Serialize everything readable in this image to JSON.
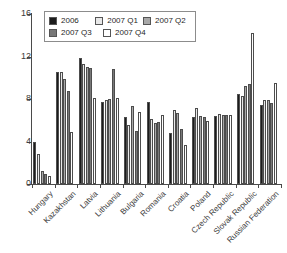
{
  "chart_data": {
    "type": "bar",
    "title": "",
    "subtitle": "",
    "xlabel": "",
    "ylabel": "",
    "ylim": [
      0,
      16
    ],
    "yticks": [
      0,
      4,
      8,
      12,
      16
    ],
    "grid": false,
    "legend_position": "top-left",
    "categories": [
      "Hungary",
      "Kazakhstan",
      "Latvia",
      "Lithuania",
      "Bulgaria",
      "Romania",
      "Croatia",
      "Poland",
      "Czech Republic",
      "Slovak Republic",
      "Russian Federation"
    ],
    "series": [
      {
        "name": "2006",
        "color": "#1c1c1c",
        "values": [
          4.0,
          10.5,
          11.9,
          7.7,
          6.3,
          7.7,
          4.8,
          6.3,
          6.4,
          8.5,
          7.4
        ]
      },
      {
        "name": "2007 Q1",
        "color": "#e8e8e8",
        "values": [
          2.8,
          10.5,
          11.3,
          7.9,
          5.6,
          6.1,
          7.0,
          7.2,
          6.6,
          8.3,
          7.9
        ]
      },
      {
        "name": "2007 Q2",
        "color": "#a8a8a8",
        "values": [
          1.2,
          9.9,
          11.0,
          8.0,
          7.3,
          5.7,
          6.7,
          6.4,
          6.5,
          9.2,
          7.9
        ]
      },
      {
        "name": "2007 Q3",
        "color": "#787878",
        "values": [
          0.9,
          8.8,
          10.9,
          10.8,
          5.0,
          5.8,
          5.2,
          6.3,
          6.5,
          9.4,
          7.6
        ]
      },
      {
        "name": "2007 Q4",
        "color": "#ffffff",
        "values": [
          0.8,
          4.9,
          8.1,
          8.1,
          6.8,
          6.5,
          3.7,
          5.9,
          6.5,
          14.2,
          9.5
        ]
      }
    ]
  },
  "legend": {
    "entries": [
      "2006",
      "2007 Q1",
      "2007 Q2",
      "2007 Q3",
      "2007 Q4"
    ]
  },
  "axis": {
    "y_tick_labels": [
      "16",
      "12",
      "8",
      "4",
      "0"
    ]
  }
}
